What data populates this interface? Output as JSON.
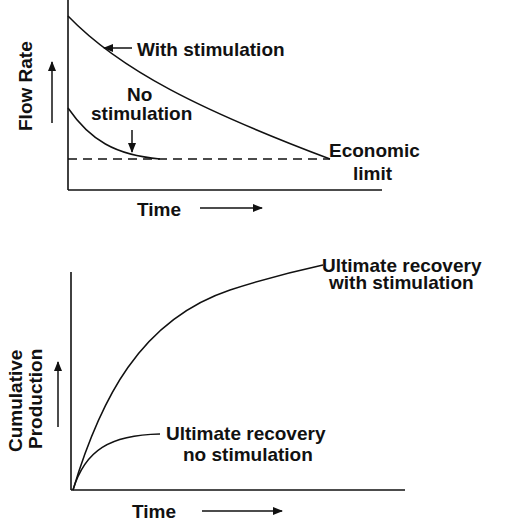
{
  "figure": {
    "top_panel": {
      "y_axis_label": "Flow Rate",
      "x_axis_label": "Time",
      "annotations": {
        "with_stimulation": "With stimulation",
        "no_stimulation_line1": "No",
        "no_stimulation_line2": "stimulation",
        "economic_limit_line1": "Economic",
        "economic_limit_line2": "limit"
      }
    },
    "bottom_panel": {
      "y_axis_label_line1": "Cumulative",
      "y_axis_label_line2": "Production",
      "x_axis_label": "Time",
      "annotations": {
        "ur_with_line1": "Ultimate recovery",
        "ur_with_line2": "with stimulation",
        "ur_no_line1": "Ultimate recovery",
        "ur_no_line2": "no stimulation"
      }
    },
    "colors": {
      "ink": "#111111",
      "background": "#ffffff"
    }
  }
}
